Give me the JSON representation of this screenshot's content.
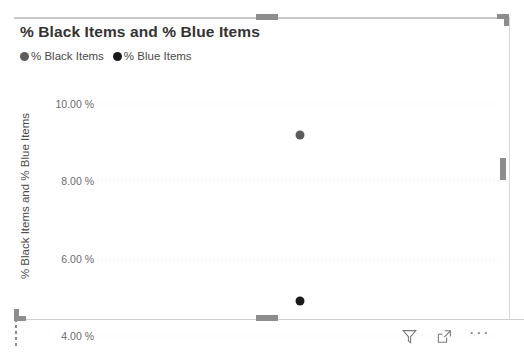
{
  "visual": {
    "title": "% Black Items and % Blue Items",
    "selected": true
  },
  "legend": {
    "items": [
      {
        "label": "% Black Items",
        "color": "#5c5c5c",
        "icon": "legend-dot-icon"
      },
      {
        "label": "% Blue Items",
        "color": "#1a1a1a",
        "icon": "legend-dot-icon"
      }
    ]
  },
  "axes": {
    "y_title": "% Black Items and % Blue Items",
    "y_ticks": [
      "10.00 %",
      "8.00 %",
      "6.00 %",
      "4.00 %"
    ]
  },
  "footer": {
    "filter_label": "Filters",
    "focus_label": "Focus mode",
    "more_label": "More options",
    "more_glyph": "···",
    "icons": [
      "filter-icon",
      "focus-mode-icon",
      "more-options-icon"
    ]
  },
  "handles": {
    "top_center": "resize-handle-top-center",
    "top_right": "resize-handle-top-right",
    "right_middle": "resize-handle-right-middle",
    "bottom_center": "resize-handle-bottom-center",
    "bottom_left": "resize-handle-bottom-left"
  },
  "chart_data": {
    "type": "scatter",
    "title": "% Black Items and % Blue Items",
    "xlabel": "",
    "ylabel": "% Black Items and % Blue Items",
    "ylim": [
      3.6,
      10.4
    ],
    "ytick_values": [
      10.0,
      8.0,
      6.0,
      4.0
    ],
    "ytick_labels": [
      "10.00 %",
      "8.00 %",
      "6.00 %",
      "4.00 %"
    ],
    "grid": true,
    "grid_style": "dotted",
    "legend_position": "top-left",
    "series": [
      {
        "name": "% Black Items",
        "color": "#5c5c5c",
        "points": [
          {
            "x": 0.5,
            "y": 9.2
          }
        ]
      },
      {
        "name": "% Blue Items",
        "color": "#1a1a1a",
        "points": [
          {
            "x": 0.5,
            "y": 4.9
          }
        ]
      }
    ]
  }
}
